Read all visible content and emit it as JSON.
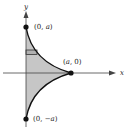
{
  "diagram": {
    "axes": {
      "x_label": "x",
      "y_label": "y"
    },
    "points": [
      {
        "id": "top",
        "label": "(0, a)",
        "text_pre": "(0, ",
        "var": "a",
        "text_post": ")"
      },
      {
        "id": "right",
        "label": "(a, 0)",
        "text_pre": "(",
        "var": "a",
        "text_post": ", 0)"
      },
      {
        "id": "bottom",
        "label": "(0, −a)",
        "text_pre": "(0, −",
        "var": "a",
        "text_post": ")"
      }
    ],
    "region": {
      "description": "Shaded region bounded by y-axis and concave astroid-like curves meeting at (a, 0)",
      "fill_color": "#c8c8c8",
      "strip": "horizontal representative rectangle"
    },
    "colors": {
      "curve": "#111111",
      "axis": "#333333",
      "shade": "#c8c8c8"
    }
  }
}
